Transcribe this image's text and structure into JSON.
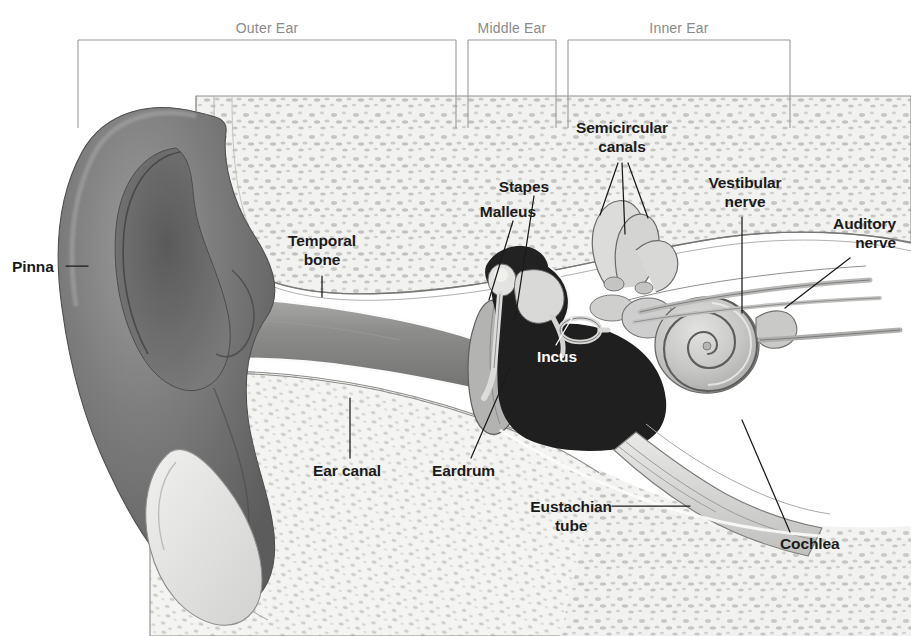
{
  "figure": {
    "background_color": "#ffffff",
    "ink_color": "#1b1b1b",
    "bracket_color": "#9a9a9a",
    "section_label_color": "#8a8a8a"
  },
  "sections": [
    {
      "id": "outer",
      "label": "Outer Ear",
      "label_x": 267,
      "label_y": 20,
      "bracket_x1": 78,
      "bracket_x2": 456,
      "bracket_top": 40,
      "bracket_drop": 88
    },
    {
      "id": "middle",
      "label": "Middle Ear",
      "label_x": 512,
      "label_y": 20,
      "bracket_x1": 468,
      "bracket_x2": 556,
      "bracket_top": 40,
      "bracket_drop": 88
    },
    {
      "id": "inner",
      "label": "Inner Ear",
      "label_x": 679,
      "label_y": 20,
      "bracket_x1": 568,
      "bracket_x2": 790,
      "bracket_top": 40,
      "bracket_drop": 88
    }
  ],
  "parts": [
    {
      "id": "pinna",
      "label": "Pinna",
      "lines": [
        "Pinna"
      ],
      "x": 12,
      "y": 258,
      "align": "left",
      "leader": [
        [
          66,
          266
        ],
        [
          88,
          266
        ]
      ],
      "color": "#1b1b1b"
    },
    {
      "id": "temporal-bone",
      "label": "Temporal bone",
      "lines": [
        "Temporal",
        "bone"
      ],
      "x": 322,
      "y": 232,
      "align": "center",
      "leader": [
        [
          322,
          276
        ],
        [
          322,
          297
        ]
      ],
      "color": "#1b1b1b"
    },
    {
      "id": "stapes",
      "label": "Stapes",
      "lines": [
        "Stapes"
      ],
      "x": 549,
      "y": 178,
      "align": "right",
      "leader": [
        [
          534,
          196
        ],
        [
          515,
          320
        ]
      ],
      "color": "#1b1b1b"
    },
    {
      "id": "malleus",
      "label": "Malleus",
      "lines": [
        "Malleus"
      ],
      "x": 536,
      "y": 203,
      "align": "right",
      "leader": [
        [
          513,
          221
        ],
        [
          489,
          300
        ]
      ],
      "color": "#1b1b1b"
    },
    {
      "id": "incus",
      "label": "Incus",
      "lines": [
        "Incus"
      ],
      "x": 537,
      "y": 348,
      "align": "left",
      "leader": [
        [
          556,
          345
        ],
        [
          570,
          318
        ]
      ],
      "color": "#ffffff"
    },
    {
      "id": "semicircular-canals",
      "label": "Semicircular canals",
      "lines": [
        "Semicircular",
        "canals"
      ],
      "x": 622,
      "y": 119,
      "align": "center",
      "leader": [
        [
          618,
          163
        ],
        [
          600,
          215
        ]
      ],
      "leader2": [
        [
          622,
          163
        ],
        [
          624,
          232
        ]
      ],
      "leader3": [
        [
          628,
          163
        ],
        [
          646,
          218
        ]
      ],
      "color": "#1b1b1b"
    },
    {
      "id": "vestibular-nerve",
      "label": "Vestibular nerve",
      "lines": [
        "Vestibular",
        "nerve"
      ],
      "x": 745,
      "y": 174,
      "align": "center",
      "leader": [
        [
          742,
          217
        ],
        [
          742,
          313
        ]
      ],
      "color": "#1b1b1b"
    },
    {
      "id": "auditory-nerve",
      "label": "Auditory nerve",
      "lines": [
        "Auditory",
        "nerve"
      ],
      "x": 896,
      "y": 215,
      "align": "right",
      "leader": [
        [
          850,
          258
        ],
        [
          785,
          308
        ]
      ],
      "color": "#1b1b1b"
    },
    {
      "id": "ear-canal",
      "label": "Ear canal",
      "lines": [
        "Ear canal"
      ],
      "x": 313,
      "y": 462,
      "align": "left",
      "leader": [
        [
          350,
          458
        ],
        [
          350,
          398
        ]
      ],
      "color": "#1b1b1b"
    },
    {
      "id": "eardrum",
      "label": "Eardrum",
      "lines": [
        "Eardrum"
      ],
      "x": 432,
      "y": 462,
      "align": "left",
      "leader": [
        [
          471,
          458
        ],
        [
          508,
          372
        ]
      ],
      "color": "#1b1b1b"
    },
    {
      "id": "eustachian-tube",
      "label": "Eustachian tube",
      "lines": [
        "Eustachian",
        "tube"
      ],
      "x": 612,
      "y": 498,
      "align": "right",
      "leader": [
        [
          612,
          506
        ],
        [
          690,
          506
        ]
      ],
      "color": "#1b1b1b"
    },
    {
      "id": "cochlea",
      "label": "Cochlea",
      "lines": [
        "Cochlea"
      ],
      "x": 780,
      "y": 535,
      "align": "left",
      "leader": [
        [
          790,
          532
        ],
        [
          742,
          420
        ]
      ],
      "color": "#1b1b1b"
    }
  ],
  "anatomy": {
    "pinna_fill": "#6e6e6e",
    "bone_fill": "#efefed",
    "bone_speckle": "#b7b7b4",
    "cavity_fill": "#1e1e1e",
    "canal_fill": "#8f8f8f",
    "cochlea_fill": "#c9c9c7",
    "outline": "#4a4a4a"
  }
}
